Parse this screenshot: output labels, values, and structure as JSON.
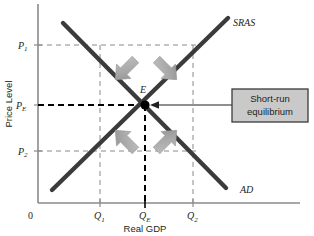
{
  "figure": {
    "axes": {
      "y_title": "Price Level",
      "x_title": "Real GDP",
      "origin_label": "0",
      "y_ticks": [
        {
          "id": "p1",
          "base": "P",
          "sub": "1",
          "y": 45
        },
        {
          "id": "pe",
          "base": "P",
          "sub": "E",
          "y": 105
        },
        {
          "id": "p2",
          "base": "P",
          "sub": "2",
          "y": 151
        }
      ],
      "x_ticks": [
        {
          "id": "q1",
          "base": "Q",
          "sub": "1",
          "x": 100
        },
        {
          "id": "qe",
          "base": "Q",
          "sub": "E",
          "x": 145
        },
        {
          "id": "q2",
          "base": "Q",
          "sub": "2",
          "x": 193
        }
      ]
    },
    "curves": [
      {
        "id": "sras",
        "label": "SRAS",
        "label_x": 233,
        "label_y": 26,
        "color": "#3b3b3b"
      },
      {
        "id": "ad",
        "label": "AD",
        "label_x": 240,
        "label_y": 192,
        "color": "#3b3b3b"
      }
    ],
    "equilibrium": {
      "point_label": "E",
      "point_x": 145,
      "point_y": 105,
      "label_x": 143,
      "label_y": 92
    },
    "callout": {
      "line1": "Short-run",
      "line2": "equilibrium",
      "fill": "#c9c9c9",
      "border": "#3b3b3b"
    },
    "adjustment_arrows": [
      {
        "id": "arrow-top-left",
        "direction": "down-right"
      },
      {
        "id": "arrow-top-right",
        "direction": "down-left"
      },
      {
        "id": "arrow-bottom-left",
        "direction": "up-right"
      },
      {
        "id": "arrow-bottom-right",
        "direction": "up-left"
      }
    ],
    "colors": {
      "curve": "#3b3b3b",
      "axis": "#8a8a8a",
      "grid_dash": "#8a8a8a",
      "equilibrium_dash": "#000000",
      "arrow_fill": "#a6a6a6",
      "text": "#231f20"
    }
  }
}
